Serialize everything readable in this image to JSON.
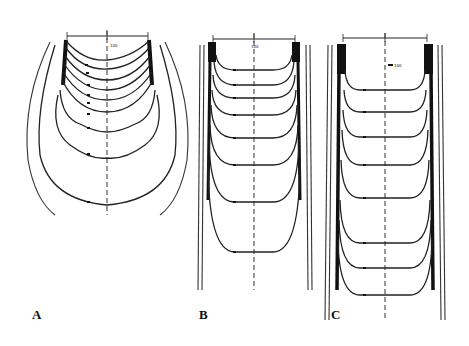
{
  "figure": {
    "panels": [
      {
        "id": "A",
        "label": "A",
        "isodose_levels": [
          "100",
          "90",
          "80",
          "70",
          "60",
          "50",
          "40",
          "30",
          "20",
          "10"
        ],
        "scale_center": "0",
        "scale_left": "5",
        "scale_right": "5"
      },
      {
        "id": "B",
        "label": "B",
        "isodose_levels": [
          "100",
          "90",
          "80",
          "70",
          "60",
          "50",
          "40",
          "30",
          "20",
          "10"
        ],
        "scale_center": "0",
        "scale_left": "5",
        "scale_right": "5"
      },
      {
        "id": "C",
        "label": "C",
        "isodose_levels": [
          "100",
          "90",
          "80",
          "70",
          "60",
          "50",
          "40",
          "30",
          "20",
          "10"
        ],
        "scale_center": "0",
        "scale_left": "5",
        "scale_right": "5"
      }
    ],
    "colors": {
      "line": "#222222",
      "background": "#ffffff"
    }
  }
}
